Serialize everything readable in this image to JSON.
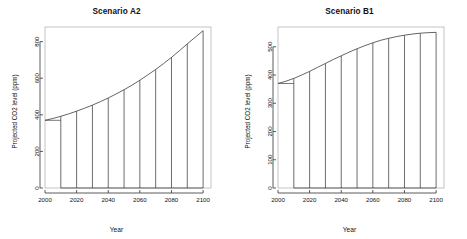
{
  "figure": {
    "background": "#ffffff",
    "line_color": "#3c3c3c",
    "axis_color": "#4a4a4a",
    "panel_count": 2
  },
  "panels": [
    {
      "id": "a2",
      "title": "Scenario A2",
      "xlabel": "Year",
      "ylabel": "Projected CO2 level (ppm)"
    },
    {
      "id": "b1",
      "title": "Scenario B1",
      "xlabel": "Year",
      "ylabel": "Projected CO2 level (ppm)"
    }
  ],
  "chart_data": [
    {
      "type": "area",
      "title": "Scenario A2",
      "xlabel": "Year",
      "ylabel": "Projected CO2 level (ppm)",
      "xlim": [
        2000,
        2105
      ],
      "ylim": [
        0,
        880
      ],
      "xticks": [
        2000,
        2020,
        2040,
        2060,
        2080,
        2100
      ],
      "xticklabels": [
        "2000",
        "2020",
        "2040",
        "2060",
        "2080",
        "2100"
      ],
      "yticks": [
        0,
        200,
        400,
        600,
        800
      ],
      "yticklabels": [
        "0",
        "200",
        "400",
        "600",
        "800"
      ],
      "grid": false,
      "legend": "none",
      "series": [
        {
          "name": "A2 projected CO2",
          "x": [
            2000,
            2005,
            2010,
            2015,
            2020,
            2025,
            2030,
            2035,
            2040,
            2045,
            2050,
            2055,
            2060,
            2065,
            2070,
            2075,
            2080,
            2085,
            2090,
            2095,
            2100
          ],
          "values": [
            370,
            380,
            392,
            405,
            420,
            436,
            453,
            472,
            492,
            514,
            537,
            562,
            589,
            618,
            648,
            680,
            714,
            750,
            788,
            824,
            860
          ]
        }
      ],
      "spikes": {
        "description": "vertical drop lines from baseline 0 to the curve at each decade",
        "x": [
          2010,
          2020,
          2030,
          2040,
          2050,
          2060,
          2070,
          2080,
          2090,
          2100
        ],
        "values": [
          392,
          420,
          453,
          492,
          537,
          589,
          648,
          714,
          788,
          860
        ]
      }
    },
    {
      "type": "area",
      "title": "Scenario B1",
      "xlabel": "Year",
      "ylabel": "Projected CO2 level (ppm)",
      "xlim": [
        2000,
        2105
      ],
      "ylim": [
        0,
        570
      ],
      "xticks": [
        2000,
        2020,
        2040,
        2060,
        2080,
        2100
      ],
      "xticklabels": [
        "2000",
        "2020",
        "2040",
        "2060",
        "2080",
        "2100"
      ],
      "yticks": [
        0,
        100,
        200,
        300,
        400,
        500
      ],
      "yticklabels": [
        "0",
        "100",
        "200",
        "300",
        "400",
        "500"
      ],
      "grid": false,
      "legend": "none",
      "series": [
        {
          "name": "B1 projected CO2",
          "x": [
            2000,
            2005,
            2010,
            2015,
            2020,
            2025,
            2030,
            2035,
            2040,
            2045,
            2050,
            2055,
            2060,
            2065,
            2070,
            2075,
            2080,
            2085,
            2090,
            2095,
            2100
          ],
          "values": [
            370,
            378,
            388,
            400,
            413,
            427,
            441,
            455,
            468,
            481,
            493,
            504,
            514,
            523,
            530,
            536,
            541,
            545,
            548,
            550,
            551
          ]
        }
      ],
      "spikes": {
        "description": "vertical drop lines from baseline 0 to the curve at each decade",
        "x": [
          2010,
          2020,
          2030,
          2040,
          2050,
          2060,
          2070,
          2080,
          2090,
          2100
        ],
        "values": [
          388,
          413,
          441,
          468,
          493,
          514,
          530,
          541,
          548,
          551
        ]
      }
    }
  ]
}
